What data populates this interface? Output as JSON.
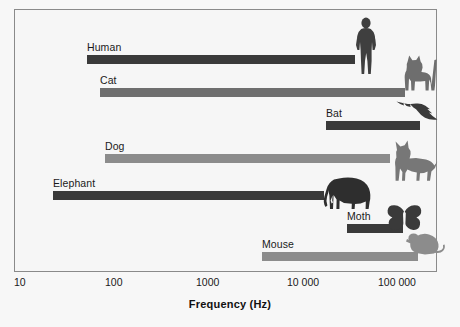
{
  "chart_data": {
    "type": "bar",
    "orientation": "horizontal",
    "scale": "log",
    "title": "",
    "xlabel": "Frequency (Hz)",
    "ylabel": "",
    "xlim": [
      10,
      200000
    ],
    "grid": false,
    "legend": "none",
    "tick_labels": [
      "10",
      "100",
      "1000",
      "10 000",
      "100 000"
    ],
    "tick_values": [
      10,
      100,
      1000,
      10000,
      100000
    ],
    "categories": [
      "Human",
      "Cat",
      "Bat",
      "Dog",
      "Elephant",
      "Moth",
      "Mouse"
    ],
    "ranges": [
      {
        "name": "Human",
        "min": 64,
        "max": 23000,
        "color": "#3a3a3a"
      },
      {
        "name": "Cat",
        "min": 90,
        "max": 85000,
        "color": "#6e6e6e"
      },
      {
        "name": "Bat",
        "min": 20000,
        "max": 160000,
        "color": "#3a3a3a"
      },
      {
        "name": "Dog",
        "min": 100,
        "max": 45000,
        "color": "#8c8c8c"
      },
      {
        "name": "Elephant",
        "min": 16,
        "max": 12000,
        "color": "#3a3a3a"
      },
      {
        "name": "Moth",
        "min": 32000,
        "max": 80000,
        "color": "#3a3a3a"
      },
      {
        "name": "Mouse",
        "min": 2200,
        "max": 91000,
        "color": "#8c8c8c"
      }
    ]
  },
  "axis": {
    "title": "Frequency (Hz)",
    "ticks": [
      {
        "label": "10",
        "x": 14
      },
      {
        "label": "100",
        "x": 105
      },
      {
        "label": "1000",
        "x": 196
      },
      {
        "label": "10 000",
        "x": 287
      },
      {
        "label": "100 000",
        "x": 378
      }
    ]
  },
  "bars": [
    {
      "label": "Human",
      "left": 87,
      "width": 268,
      "top": 55,
      "color": "#3a3a3a",
      "label_x": 87,
      "label_y": 41
    },
    {
      "label": "Cat",
      "left": 100,
      "width": 305,
      "top": 88,
      "color": "#6e6e6e",
      "label_x": 100,
      "label_y": 74
    },
    {
      "label": "Bat",
      "left": 326,
      "width": 94,
      "top": 121,
      "color": "#3a3a3a",
      "label_x": 326,
      "label_y": 107
    },
    {
      "label": "Dog",
      "left": 105,
      "width": 285,
      "top": 154,
      "color": "#8c8c8c",
      "label_x": 105,
      "label_y": 140
    },
    {
      "label": "Elephant",
      "left": 53,
      "width": 271,
      "top": 191,
      "color": "#3a3a3a",
      "label_x": 53,
      "label_y": 177
    },
    {
      "label": "Moth",
      "left": 347,
      "width": 56,
      "top": 224,
      "color": "#3a3a3a",
      "label_x": 347,
      "label_y": 210
    },
    {
      "label": "Mouse",
      "left": 262,
      "width": 156,
      "top": 252,
      "color": "#8c8c8c",
      "label_x": 262,
      "label_y": 238
    }
  ],
  "icons": [
    {
      "name": "human-silhouette-icon",
      "left": 352,
      "top": 17,
      "w": 28,
      "h": 58,
      "color": "#3f3f3f"
    },
    {
      "name": "cat-silhouette-icon",
      "left": 401,
      "top": 52,
      "w": 38,
      "h": 40,
      "color": "#6e6e6e"
    },
    {
      "name": "bat-silhouette-icon",
      "left": 396,
      "top": 98,
      "w": 42,
      "h": 24,
      "color": "#3a3a3a"
    },
    {
      "name": "dog-silhouette-icon",
      "left": 390,
      "top": 140,
      "w": 48,
      "h": 42,
      "color": "#777777"
    },
    {
      "name": "elephant-silhouette-icon",
      "left": 322,
      "top": 176,
      "w": 50,
      "h": 34,
      "color": "#2e2e2e"
    },
    {
      "name": "butterfly-moth-icon",
      "left": 386,
      "top": 204,
      "w": 38,
      "h": 30,
      "color": "#3a3a3a"
    },
    {
      "name": "mouse-silhouette-icon",
      "left": 404,
      "top": 230,
      "w": 42,
      "h": 30,
      "color": "#8c8c8c"
    }
  ]
}
